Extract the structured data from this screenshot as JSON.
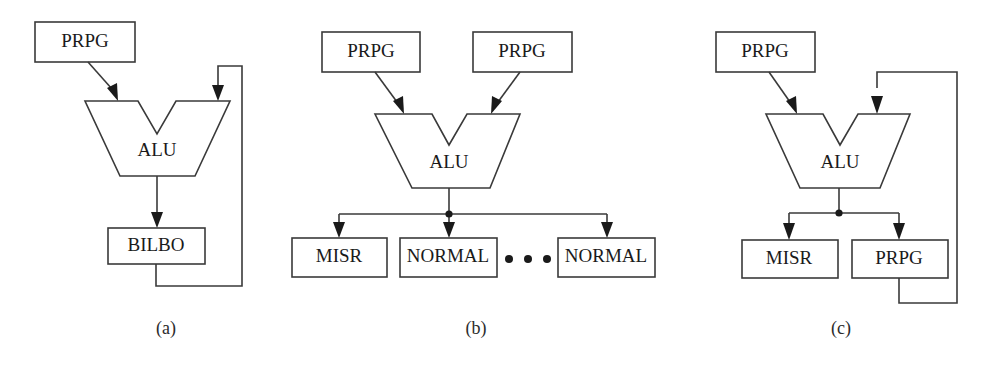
{
  "figure": {
    "background_color": "#ffffff",
    "line_color": "#3a3a3a",
    "text_color": "#1a1a1a",
    "width": 993,
    "height": 366
  },
  "panels": [
    {
      "id": "a",
      "caption": "(a)",
      "blocks": [
        {
          "name": "prpg-top",
          "label": "PRPG"
        },
        {
          "name": "alu",
          "label": "ALU"
        },
        {
          "name": "bilbo",
          "label": "BILBO"
        }
      ],
      "has_feedback_loop": true,
      "has_fanout_dot": false,
      "ellipsis": ""
    },
    {
      "id": "b",
      "caption": "(b)",
      "blocks": [
        {
          "name": "prpg-left",
          "label": "PRPG"
        },
        {
          "name": "prpg-right",
          "label": "PRPG"
        },
        {
          "name": "alu",
          "label": "ALU"
        },
        {
          "name": "misr",
          "label": "MISR"
        },
        {
          "name": "normal-first",
          "label": "NORMAL"
        },
        {
          "name": "normal-last",
          "label": "NORMAL"
        }
      ],
      "has_feedback_loop": false,
      "has_fanout_dot": true,
      "ellipsis": "•  •  •"
    },
    {
      "id": "c",
      "caption": "(c)",
      "blocks": [
        {
          "name": "prpg-top",
          "label": "PRPG"
        },
        {
          "name": "alu",
          "label": "ALU"
        },
        {
          "name": "misr",
          "label": "MISR"
        },
        {
          "name": "prpg-bottom",
          "label": "PRPG"
        }
      ],
      "has_feedback_loop": true,
      "has_fanout_dot": true,
      "ellipsis": ""
    }
  ]
}
